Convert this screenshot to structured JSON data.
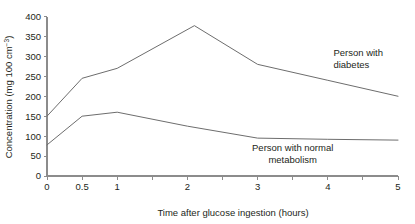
{
  "chart_data": {
    "type": "line",
    "title": "",
    "xlabel": "Time after glucose ingestion (hours)",
    "ylabel": "Concentration (mg 100 cm⁻³)",
    "ylabel_main": "Concentration (mg 100 cm",
    "ylabel_sup": "−3",
    "ylabel_close": ")",
    "xlim": [
      0,
      5
    ],
    "ylim": [
      0,
      400
    ],
    "grid": false,
    "legend_position": "inline-annotations",
    "x_ticks": [
      0,
      0.5,
      1,
      1.5,
      2,
      2.5,
      3,
      3.5,
      4,
      4.5,
      5
    ],
    "x_tick_labels": [
      "0",
      "0.5",
      "1",
      "",
      "2",
      "",
      "3",
      "",
      "4",
      "",
      "5"
    ],
    "y_ticks": [
      0,
      50,
      100,
      150,
      200,
      250,
      300,
      350,
      400
    ],
    "y_tick_labels": [
      "0",
      "50",
      "100",
      "150",
      "200",
      "250",
      "300",
      "350",
      "400"
    ],
    "series": [
      {
        "name": "Person with diabetes",
        "color": "#6d6d6d",
        "x": [
          0,
          0.5,
          1,
          2.1,
          3,
          4,
          5
        ],
        "values": [
          150,
          245,
          270,
          377,
          280,
          240,
          200
        ],
        "annotation": {
          "line1": "Person with",
          "line2": "diabetes",
          "x": 4.08,
          "y": 300
        }
      },
      {
        "name": "Person with normal metabolism",
        "color": "#6d6d6d",
        "x": [
          0,
          0.5,
          1,
          2,
          3,
          4,
          5
        ],
        "values": [
          78,
          150,
          160,
          125,
          95,
          92,
          90
        ],
        "annotation": {
          "line1": "Person with normal",
          "line2": "metabolism",
          "x": 3.5,
          "y": 62
        }
      }
    ]
  }
}
